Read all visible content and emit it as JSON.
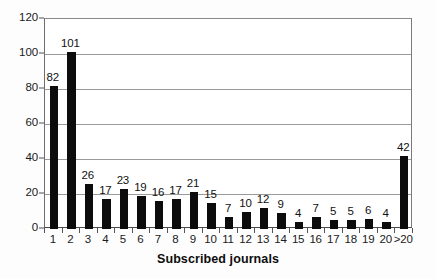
{
  "chart_data": {
    "type": "bar",
    "title": "",
    "xlabel": "Subscribed journals",
    "ylabel": "",
    "categories": [
      "1",
      "2",
      "3",
      "4",
      "5",
      "6",
      "7",
      "8",
      "9",
      "10",
      "11",
      "12",
      "13",
      "14",
      "15",
      "16",
      "17",
      "18",
      "19",
      "20",
      ">20"
    ],
    "values": [
      82,
      101,
      26,
      17,
      23,
      19,
      16,
      17,
      21,
      15,
      7,
      10,
      12,
      9,
      4,
      7,
      5,
      5,
      6,
      4,
      42
    ],
    "ylim": [
      0,
      120
    ],
    "y_ticks": [
      0,
      20,
      40,
      60,
      80,
      100,
      120
    ],
    "grid": true,
    "legend": null,
    "bar_color": "#0c0c0c",
    "grid_color": "#9a9a9a",
    "axis_color": "#4a4a4a",
    "background": "#ffffff",
    "data_labels_shown": true
  }
}
